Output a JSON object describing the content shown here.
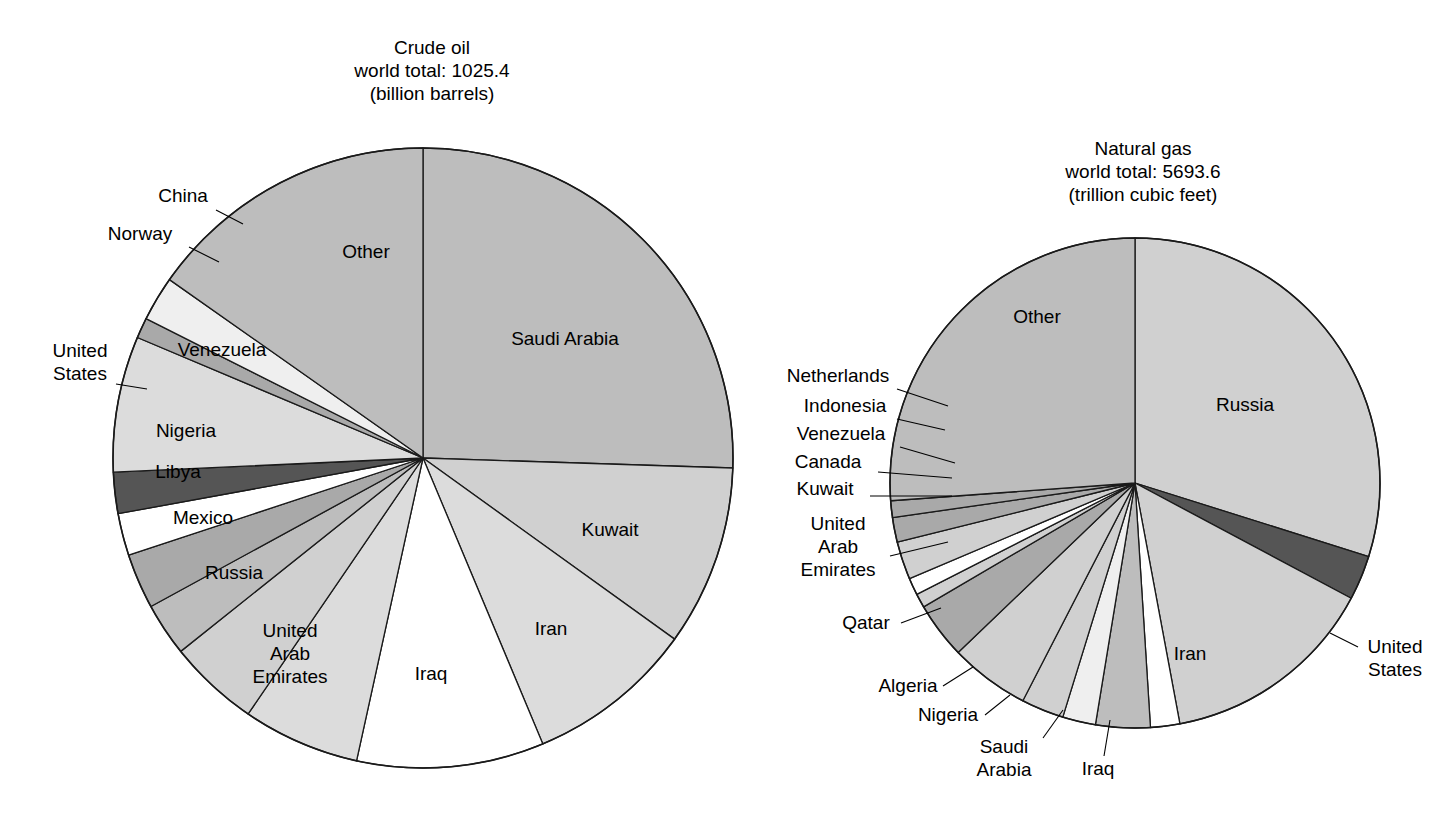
{
  "figure": {
    "background": "#ffffff",
    "stroke_color": "#1a1a1a",
    "palette": {
      "white": "#ffffff",
      "very_light": "#efefef",
      "light": "#dcdcdc",
      "mid_light": "#d0d0d0",
      "mid": "#bdbdbd",
      "mid_dark": "#a9a9a9",
      "dark": "#555555"
    }
  },
  "chart_data": [
    {
      "type": "pie",
      "id": "crude-oil",
      "title": "Crude oil",
      "subtitle": "world total: 1025.4",
      "units": "(billion barrels)",
      "total": 1025.4,
      "total_units": "billion barrels",
      "start_angle_deg": 0,
      "direction": "clockwise",
      "center": [
        423,
        458
      ],
      "radius": 310,
      "labels": [
        "Saudi Arabia",
        "Kuwait",
        "Iran",
        "Iraq",
        "United Arab Emirates",
        "Russia",
        "Mexico",
        "Libya",
        "Nigeria",
        "United States",
        "Venezuela",
        "Norway",
        "China",
        "Other"
      ],
      "values": [
        261.5,
        96.5,
        89.7,
        100.0,
        62.5,
        48.6,
        28.4,
        29.5,
        22.5,
        22.0,
        72.6,
        10.9,
        24.0,
        156.2
      ],
      "percent": [
        25.5,
        9.4,
        8.7,
        9.8,
        6.1,
        4.7,
        2.8,
        2.9,
        2.2,
        2.1,
        7.1,
        1.1,
        2.3,
        15.3
      ],
      "fills": [
        "mid",
        "mid_light",
        "light",
        "white",
        "light",
        "mid_light",
        "mid",
        "mid_dark",
        "white",
        "dark",
        "light",
        "mid_dark",
        "very_light",
        "mid"
      ],
      "label_placement": [
        "inside",
        "inside",
        "inside",
        "inside",
        "inside",
        "inside",
        "inside",
        "inside",
        "inside",
        "outside",
        "inside",
        "outside",
        "outside",
        "inside"
      ],
      "legend": "none",
      "grid": false
    },
    {
      "type": "pie",
      "id": "natural-gas",
      "title": "Natural gas",
      "subtitle": "world total: 5693.6",
      "units": "(trillion cubic feet)",
      "total": 5693.6,
      "total_units": "trillion cubic feet",
      "start_angle_deg": 0,
      "direction": "clockwise",
      "center": [
        1135,
        483
      ],
      "radius": 245,
      "labels": [
        "Russia",
        "United States",
        "Iran",
        "Iraq",
        "Saudi Arabia",
        "Nigeria",
        "Algeria",
        "Qatar",
        "United Arab Emirates",
        "Kuwait",
        "Canada",
        "Venezuela",
        "Indonesia",
        "Netherlands",
        "Other"
      ],
      "values": [
        1700.0,
        167.4,
        812.3,
        109.8,
        204.5,
        124.0,
        159.7,
        300.0,
        212.0,
        52.9,
        63.9,
        143.0,
        92.5,
        62.5,
        1489.1
      ],
      "percent": [
        29.9,
        2.9,
        14.3,
        1.9,
        3.6,
        2.2,
        2.8,
        5.3,
        3.7,
        0.9,
        1.1,
        2.5,
        1.6,
        1.1,
        26.2
      ],
      "fills": [
        "mid_light",
        "dark",
        "mid_light",
        "white",
        "mid",
        "very_light",
        "mid_light",
        "mid_light",
        "mid_dark",
        "mid_light",
        "white",
        "mid_light",
        "mid_dark",
        "mid_dark",
        "mid"
      ],
      "label_placement": [
        "inside",
        "outside",
        "inside",
        "outside",
        "outside",
        "outside",
        "outside",
        "outside",
        "outside",
        "outside",
        "outside",
        "outside",
        "outside",
        "outside",
        "inside"
      ],
      "legend": "none",
      "grid": false
    }
  ],
  "crude_oil_chart": {
    "title_line1": "Crude oil",
    "title_line2": "world total: 1025.4",
    "title_line3": "(billion barrels)",
    "inside_labels": [
      {
        "name": "Saudi Arabia",
        "text": "Saudi Arabia",
        "x": 565,
        "y": 345
      },
      {
        "name": "Kuwait",
        "text": "Kuwait",
        "x": 610,
        "y": 536
      },
      {
        "name": "Iran",
        "text": "Iran",
        "x": 551,
        "y": 635
      },
      {
        "name": "Iraq",
        "text": "Iraq",
        "x": 431,
        "y": 680
      },
      {
        "name": "Russia",
        "text": "Russia",
        "x": 234,
        "y": 579
      },
      {
        "name": "Mexico",
        "text": "Mexico",
        "x": 203,
        "y": 524
      },
      {
        "name": "Libya",
        "text": "Libya",
        "x": 178,
        "y": 478
      },
      {
        "name": "Nigeria",
        "text": "Nigeria",
        "x": 186,
        "y": 437
      },
      {
        "name": "Venezuela",
        "text": "Venezuela",
        "x": 222,
        "y": 356
      },
      {
        "name": "Other",
        "text": "Other",
        "x": 366,
        "y": 258
      }
    ],
    "uae_label": {
      "name": "United Arab Emirates",
      "lines": [
        "United",
        "Arab",
        "Emirates"
      ],
      "x": 290,
      "y": 637
    },
    "outside_labels": [
      {
        "name": "China",
        "lines": [
          "China"
        ],
        "x": 183,
        "y": 202,
        "anchor": "middle",
        "leader": [
          [
            216,
            210
          ],
          [
            243,
            224
          ]
        ]
      },
      {
        "name": "Norway",
        "lines": [
          "Norway"
        ],
        "x": 140,
        "y": 240,
        "anchor": "middle",
        "leader": [
          [
            189,
            247
          ],
          [
            219,
            262
          ]
        ]
      },
      {
        "name": "United States",
        "lines": [
          "United",
          "States"
        ],
        "x": 80,
        "y": 357,
        "anchor": "middle",
        "leader": [
          [
            116,
            384
          ],
          [
            147,
            389
          ]
        ]
      }
    ]
  },
  "natural_gas_chart": {
    "title_line1": "Natural gas",
    "title_line2": "world total: 5693.6",
    "title_line3": "(trillion cubic feet)",
    "inside_labels": [
      {
        "name": "Russia",
        "text": "Russia",
        "x": 1245,
        "y": 411
      },
      {
        "name": "Iran",
        "text": "Iran",
        "x": 1190,
        "y": 660
      },
      {
        "name": "Other",
        "text": "Other",
        "x": 1037,
        "y": 323
      }
    ],
    "outside_labels": [
      {
        "name": "Netherlands",
        "lines": [
          "Netherlands"
        ],
        "x": 838,
        "y": 382,
        "anchor": "middle",
        "leader": [
          [
            897,
            389
          ],
          [
            948,
            406
          ]
        ]
      },
      {
        "name": "Indonesia",
        "lines": [
          "Indonesia"
        ],
        "x": 845,
        "y": 412,
        "anchor": "middle",
        "leader": [
          [
            897,
            419
          ],
          [
            945,
            430
          ]
        ]
      },
      {
        "name": "Venezuela",
        "lines": [
          "Venezuela"
        ],
        "x": 841,
        "y": 440,
        "anchor": "middle",
        "leader": [
          [
            900,
            447
          ],
          [
            955,
            463
          ]
        ]
      },
      {
        "name": "Canada",
        "lines": [
          "Canada"
        ],
        "x": 828,
        "y": 468,
        "anchor": "middle",
        "leader": [
          [
            878,
            472
          ],
          [
            952,
            478
          ]
        ]
      },
      {
        "name": "Kuwait",
        "lines": [
          "Kuwait"
        ],
        "x": 825,
        "y": 495,
        "anchor": "middle",
        "leader": [
          [
            870,
            496
          ],
          [
            952,
            496
          ]
        ]
      },
      {
        "name": "United Arab Emirates",
        "lines": [
          "United",
          "Arab",
          "Emirates"
        ],
        "x": 838,
        "y": 530,
        "anchor": "middle",
        "leader": [
          [
            890,
            556
          ],
          [
            948,
            542
          ]
        ]
      },
      {
        "name": "Qatar",
        "lines": [
          "Qatar"
        ],
        "x": 866,
        "y": 629,
        "anchor": "middle",
        "leader": [
          [
            901,
            623
          ],
          [
            941,
            608
          ]
        ]
      },
      {
        "name": "Algeria",
        "lines": [
          "Algeria"
        ],
        "x": 908,
        "y": 692,
        "anchor": "middle",
        "leader": [
          [
            943,
            686
          ],
          [
            973,
            667
          ]
        ]
      },
      {
        "name": "Nigeria",
        "lines": [
          "Nigeria"
        ],
        "x": 948,
        "y": 721,
        "anchor": "middle",
        "leader": [
          [
            985,
            715
          ],
          [
            1010,
            695
          ]
        ]
      },
      {
        "name": "Saudi Arabia",
        "lines": [
          "Saudi",
          "Arabia"
        ],
        "x": 1004,
        "y": 753,
        "anchor": "middle",
        "leader": [
          [
            1043,
            738
          ],
          [
            1063,
            710
          ]
        ]
      },
      {
        "name": "Iraq",
        "lines": [
          "Iraq"
        ],
        "x": 1098,
        "y": 775,
        "anchor": "middle",
        "leader": [
          [
            1104,
            756
          ],
          [
            1110,
            720
          ]
        ]
      },
      {
        "name": "United States",
        "lines": [
          "United",
          "States"
        ],
        "x": 1395,
        "y": 653,
        "anchor": "middle",
        "leader": [
          [
            1358,
            647
          ],
          [
            1330,
            633
          ]
        ]
      }
    ]
  }
}
